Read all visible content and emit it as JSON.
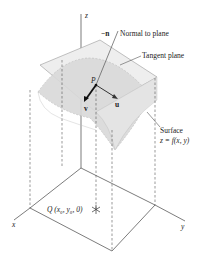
{
  "diagram": {
    "axes": {
      "x": "x",
      "y": "y",
      "z": "z"
    },
    "labels": {
      "neg_n": "−n",
      "normal": "Normal to plane",
      "tangent": "Tangent plane",
      "point_p": "P",
      "vec_u": "u",
      "vec_v": "v",
      "surface": "Surface",
      "surface_eq": "z = f(x, y)",
      "point_q": "Q (x₀, y₀, 0)"
    },
    "colors": {
      "line": "#333333",
      "surface_fill": "#d9d9d9",
      "plane_fill": "#eeeeee",
      "background": "#ffffff"
    }
  }
}
